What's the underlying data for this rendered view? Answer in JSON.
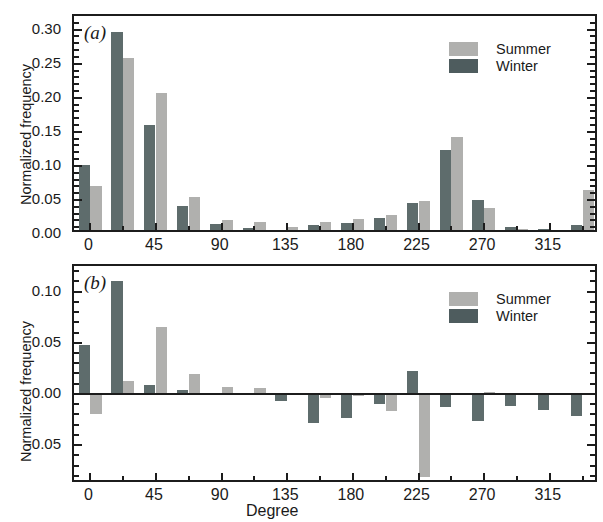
{
  "figure": {
    "background": "#ffffff",
    "series_colors": {
      "summer": "#b0b0ae",
      "winter": "#5e6c6c"
    }
  },
  "legend": {
    "summer_label": "Summer",
    "winter_label": "Winter"
  },
  "panel_a": {
    "tag": "(a)",
    "ylabel": "Normalized frequency",
    "ytick_labels": [
      "0.00",
      "0.05",
      "0.10",
      "0.15",
      "0.20",
      "0.25",
      "0.30"
    ],
    "xtick_labels": [
      "0",
      "45",
      "90",
      "135",
      "180",
      "225",
      "270",
      "315"
    ]
  },
  "panel_b": {
    "tag": "(b)",
    "ylabel": "Normalized frequency",
    "xlabel": "Degree",
    "ytick_labels": [
      "-0.05",
      "0.00",
      "0.05",
      "0.10"
    ],
    "xtick_labels": [
      "0",
      "45",
      "90",
      "135",
      "180",
      "225",
      "270",
      "315"
    ]
  },
  "chart_data": [
    {
      "type": "bar",
      "id": "panel_a",
      "title": "(a)",
      "xlabel": "",
      "ylabel": "Normalized frequency",
      "xlim": [
        -11.25,
        348.75
      ],
      "ylim": [
        0.0,
        0.32
      ],
      "ytick_values": [
        0.0,
        0.05,
        0.1,
        0.15,
        0.2,
        0.25,
        0.3
      ],
      "xtick_values": [
        0,
        45,
        90,
        135,
        180,
        225,
        270,
        315
      ],
      "grid": false,
      "legend_position": "upper-right",
      "categories": [
        0,
        22.5,
        45,
        67.5,
        90,
        112.5,
        135,
        157.5,
        180,
        202.5,
        225,
        247.5,
        270,
        292.5,
        315,
        337.5
      ],
      "series": [
        {
          "name": "Winter",
          "color": "#5e6c6c",
          "values": [
            0.102,
            0.296,
            0.16,
            0.041,
            0.015,
            0.009,
            0.005,
            0.013,
            0.016,
            0.024,
            0.045,
            0.124,
            0.05,
            0.011,
            0.008,
            0.013
          ]
        },
        {
          "name": "Summer",
          "color": "#b0b0ae",
          "values": [
            0.07,
            0.259,
            0.207,
            0.054,
            0.02,
            0.017,
            0.01,
            0.018,
            0.022,
            0.028,
            0.049,
            0.143,
            0.038,
            0.007,
            0.006,
            0.064
          ]
        }
      ]
    },
    {
      "type": "bar",
      "id": "panel_b",
      "title": "(b)",
      "xlabel": "Degree",
      "ylabel": "Normalized frequency",
      "xlim": [
        -11.25,
        348.75
      ],
      "ylim": [
        -0.088,
        0.125
      ],
      "ytick_values": [
        -0.05,
        0.0,
        0.05,
        0.1
      ],
      "xtick_values": [
        0,
        45,
        90,
        135,
        180,
        225,
        270,
        315
      ],
      "grid": false,
      "legend_position": "upper-right",
      "categories": [
        0,
        22.5,
        45,
        67.5,
        90,
        112.5,
        135,
        157.5,
        180,
        202.5,
        225,
        247.5,
        270,
        292.5,
        315,
        337.5
      ],
      "series": [
        {
          "name": "Winter",
          "color": "#5e6c6c",
          "values": [
            0.048,
            0.11,
            0.009,
            0.004,
            -0.001,
            0.001,
            -0.007,
            -0.028,
            -0.024,
            -0.01,
            0.022,
            -0.013,
            -0.026,
            -0.012,
            -0.016,
            -0.022
          ]
        },
        {
          "name": "Summer",
          "color": "#b0b0ae",
          "values": [
            -0.02,
            0.013,
            0.065,
            0.019,
            0.007,
            0.006,
            0.001,
            -0.004,
            -0.002,
            -0.017,
            -0.081,
            0.0,
            0.002,
            0.0,
            0.0,
            0.0
          ]
        }
      ]
    }
  ]
}
